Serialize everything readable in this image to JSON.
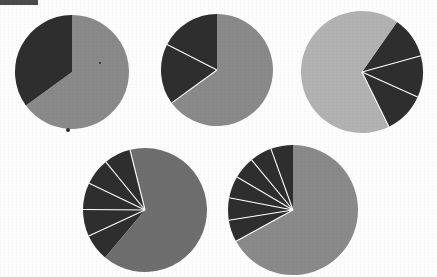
{
  "figure": {
    "caption": "",
    "background_color": "#fdfdfd",
    "scan_artifact": {
      "name": "scan-edge-bar",
      "x": 0,
      "y": 0,
      "width": 38,
      "height": 5,
      "color": "#4a4a4a"
    },
    "specks": [
      {
        "x": 68,
        "y": 130,
        "r": 2.2,
        "color": "#2c2c2c"
      },
      {
        "x": 213,
        "y": 47,
        "r": 1.2,
        "color": "#2c2c2c"
      },
      {
        "x": 100,
        "y": 63,
        "r": 0.9,
        "color": "#2c2c2c"
      }
    ]
  },
  "chart_data": [
    {
      "type": "pie",
      "title": "Pie 1",
      "id": "pie-1",
      "center": {
        "x": 72,
        "y": 72
      },
      "radius": 57,
      "start_angle": -90,
      "direction": "clockwise",
      "separator_color": "#ffffff",
      "separator_width": 0,
      "categories": [
        "Slice A",
        "Slice B"
      ],
      "values": [
        65,
        35
      ],
      "colors": [
        "#8a8a8a",
        "#2e2e2e"
      ],
      "labels": [],
      "legend": null
    },
    {
      "type": "pie",
      "title": "Pie 2",
      "id": "pie-2",
      "center": {
        "x": 217,
        "y": 70
      },
      "radius": 56,
      "start_angle": -90,
      "direction": "clockwise",
      "separator_color": "#ffffff",
      "separator_width": 1.1,
      "categories": [
        "Slice A",
        "Slice B",
        "Slice C"
      ],
      "values": [
        65,
        17.5,
        17.5
      ],
      "colors": [
        "#8a8a8a",
        "#2e2e2e",
        "#2e2e2e"
      ],
      "labels": [],
      "legend": null
    },
    {
      "type": "pie",
      "title": "Pie 3",
      "id": "pie-3",
      "center": {
        "x": 362,
        "y": 72
      },
      "radius": 61,
      "start_angle": -55,
      "direction": "clockwise",
      "separator_color": "#ffffff",
      "separator_width": 1.1,
      "categories": [
        "Slice A",
        "Slice B",
        "Slice C",
        "Slice D"
      ],
      "values": [
        11,
        11,
        11,
        67
      ],
      "colors": [
        "#2e2e2e",
        "#2e2e2e",
        "#2e2e2e",
        "#b2b2b2"
      ],
      "labels": [],
      "legend": null
    },
    {
      "type": "pie",
      "title": "Pie 4",
      "id": "pie-4",
      "center": {
        "x": 145,
        "y": 210
      },
      "radius": 62,
      "start_angle": 130,
      "direction": "clockwise",
      "separator_color": "#ffffff",
      "separator_width": 1.1,
      "categories": [
        "Slice A",
        "Slice B",
        "Slice C",
        "Slice D",
        "Slice E",
        "Slice F"
      ],
      "values": [
        7,
        7,
        7,
        7,
        7,
        65
      ],
      "colors": [
        "#2e2e2e",
        "#2e2e2e",
        "#2e2e2e",
        "#2e2e2e",
        "#2e2e2e",
        "#6e6e6e"
      ],
      "labels": [],
      "legend": null
    },
    {
      "type": "pie",
      "title": "Pie 5",
      "id": "pie-5",
      "center": {
        "x": 293,
        "y": 210
      },
      "radius": 65,
      "start_angle": -90,
      "direction": "counterclockwise",
      "separator_color": "#ffffff",
      "separator_width": 1.1,
      "categories": [
        "Slice A",
        "Slice B",
        "Slice C",
        "Slice D",
        "Slice E",
        "Slice F",
        "Slice G"
      ],
      "values": [
        5.5,
        5.5,
        5.5,
        5.5,
        5.5,
        5.5,
        67
      ],
      "colors": [
        "#2e2e2e",
        "#2e2e2e",
        "#2e2e2e",
        "#2e2e2e",
        "#2e2e2e",
        "#2e2e2e",
        "#8a8a8a"
      ],
      "labels": [],
      "legend": null
    }
  ]
}
